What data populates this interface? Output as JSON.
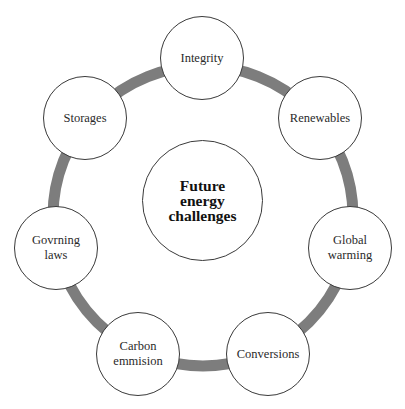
{
  "diagram": {
    "type": "hub-and-ring",
    "ring_color": "#7d7d7d",
    "center": {
      "label": "Future\nenergy\nchallenges"
    },
    "nodes": [
      {
        "label": "Integrity"
      },
      {
        "label": "Renewables"
      },
      {
        "label": "Global\nwarming"
      },
      {
        "label": "Conversions"
      },
      {
        "label": "Carbon\nemmision"
      },
      {
        "label": "Govrning\nlaws"
      },
      {
        "label": "Storages"
      }
    ]
  }
}
